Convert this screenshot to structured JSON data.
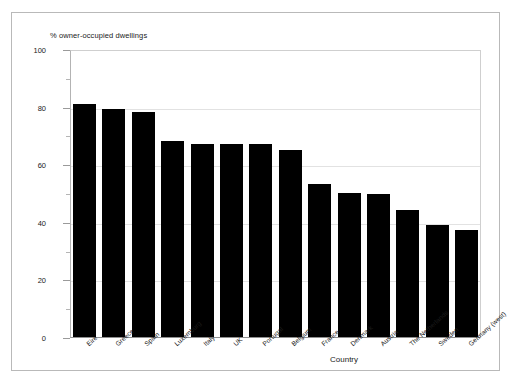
{
  "chart_data": {
    "type": "bar",
    "title": "",
    "subtitle": "",
    "ylabel": "% owner-occupied dwellings",
    "xlabel": "Country",
    "ylim": [
      0,
      100
    ],
    "ytick_labels": [
      "0",
      "20",
      "40",
      "60",
      "80",
      "100"
    ],
    "ytick_values": [
      0,
      20,
      40,
      60,
      80,
      100
    ],
    "yminor_values": [
      10,
      30,
      50,
      70,
      90
    ],
    "grid": true,
    "legend": null,
    "bar_color": "#000000",
    "categories": [
      "Eire",
      "Greece",
      "Spain",
      "Luxemburg",
      "Italy",
      "UK",
      "Portugal",
      "Belgium",
      "France",
      "Denmark",
      "Austria",
      "The Netherlands",
      "Sweden",
      "Germany (west)"
    ],
    "values": [
      81,
      79,
      78,
      68,
      67,
      67,
      67,
      65,
      53,
      50,
      49.5,
      44,
      39,
      37
    ]
  }
}
